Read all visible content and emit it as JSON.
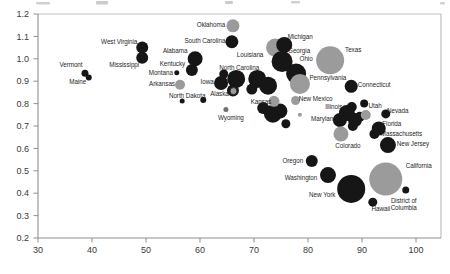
{
  "chart_data": {
    "type": "scatter",
    "title": "",
    "xlabel": "",
    "ylabel": "",
    "xlim": [
      30,
      104.6
    ],
    "ylim": [
      0.2,
      1.2
    ],
    "grid": false,
    "legend": "none",
    "colors": {
      "black": "#161616",
      "gray": "#9b9b9b",
      "darkgray": "#6f6f6f",
      "label": "#1f1f1f",
      "axis": "#8f8f8f",
      "frame": "#bfbfbf",
      "tick_text": "#3a3a3a"
    },
    "x_axis": {
      "ticks": [
        {
          "v": 30,
          "label": "30"
        },
        {
          "v": 40,
          "label": "40"
        },
        {
          "v": 50,
          "label": "50"
        },
        {
          "v": 60,
          "label": "60"
        },
        {
          "v": 70,
          "label": "70"
        },
        {
          "v": 80,
          "label": "80"
        },
        {
          "v": 90,
          "label": "90"
        },
        {
          "v": 100,
          "label": "100"
        }
      ]
    },
    "y_axis": {
      "ticks": [
        {
          "v": 1.2,
          "label": "1.2"
        },
        {
          "v": 1.1,
          "label": "1.1"
        },
        {
          "v": 1.0,
          "label": "1.0"
        },
        {
          "v": 0.9,
          "label": "0.9"
        },
        {
          "v": 0.8,
          "label": "0.8"
        },
        {
          "v": 0.7,
          "label": "0.7"
        },
        {
          "v": 0.6,
          "label": "0.6"
        },
        {
          "v": 0.5,
          "label": "0.5"
        },
        {
          "v": 0.4,
          "label": "0.4"
        },
        {
          "v": 0.3,
          "label": "0.3"
        },
        {
          "v": 0.2,
          "label": "0.2"
        }
      ]
    },
    "points": [
      {
        "name": "Louisiana",
        "x": 73.9,
        "y": 1.05,
        "r": 9,
        "c": "gray",
        "label": {
          "dx": -25,
          "dy": 7,
          "lines": [
            "Louisiana"
          ]
        }
      },
      {
        "name": "Vermont",
        "x": 38.7,
        "y": 0.935,
        "r": 3.5,
        "c": "black",
        "label": {
          "dx": -14,
          "dy": -8,
          "lines": [
            "Vermont"
          ]
        }
      },
      {
        "name": "Maine",
        "x": 39.4,
        "y": 0.917,
        "r": 3,
        "c": "black",
        "label": {
          "dx": -11,
          "dy": 5,
          "lines": [
            "Maine"
          ]
        }
      },
      {
        "name": "West Virginia",
        "x": 49.3,
        "y": 1.05,
        "r": 6,
        "c": "black",
        "label": {
          "dx": -23,
          "dy": -5.5,
          "lines": [
            "West Virginia"
          ]
        }
      },
      {
        "name": "Mississippi",
        "x": 49.3,
        "y": 1.005,
        "r": 6,
        "c": "black",
        "label": {
          "dx": -18,
          "dy": 7.5,
          "lines": [
            "Mississippi"
          ]
        }
      },
      {
        "name": "South Carolina",
        "x": 65.9,
        "y": 1.076,
        "r": 6.5,
        "c": "black",
        "label": {
          "dx": -27,
          "dy": -0.5,
          "lines": [
            "South Carolina"
          ]
        }
      },
      {
        "name": "Alabama",
        "x": 59.1,
        "y": 1.0,
        "r": 7.5,
        "c": "black",
        "label": {
          "dx": -20,
          "dy": -8,
          "lines": [
            "Alabama"
          ]
        }
      },
      {
        "name": "Kentucky",
        "x": 58.5,
        "y": 0.95,
        "r": 6,
        "c": "black",
        "label": {
          "dx": -19.5,
          "dy": -6.5,
          "lines": [
            "Kentucky"
          ]
        }
      },
      {
        "name": "Montana",
        "x": 55.7,
        "y": 0.938,
        "r": 2.5,
        "c": "black",
        "label": {
          "dx": -16,
          "dy": 0,
          "lines": [
            "Montana"
          ]
        }
      },
      {
        "name": "North Dakota",
        "x": 56.7,
        "y": 0.812,
        "r": 2.5,
        "c": "black",
        "label": {
          "dx": 5,
          "dy": -5,
          "lines": [
            "North Dakota"
          ]
        }
      },
      {
        "name": null,
        "x": 60.6,
        "y": 0.816,
        "r": 3,
        "c": "black"
      },
      {
        "name": null,
        "x": 64.4,
        "y": 0.932,
        "r": 4.5,
        "c": "black"
      },
      {
        "name": "Iowa",
        "x": 63.9,
        "y": 0.892,
        "r": 7,
        "c": "black",
        "label": {
          "dx": -14,
          "dy": -0.5,
          "lines": [
            "Iowa"
          ]
        }
      },
      {
        "name": "North Carolina",
        "x": 66.7,
        "y": 0.91,
        "r": 9,
        "c": "black",
        "label": {
          "dx": 3,
          "dy": -11,
          "lines": [
            "North Carolina"
          ]
        }
      },
      {
        "name": null,
        "x": 66.1,
        "y": 0.858,
        "r": 6,
        "c": "black"
      },
      {
        "name": null,
        "x": 70.6,
        "y": 0.91,
        "r": 9,
        "c": "black"
      },
      {
        "name": null,
        "x": 72.6,
        "y": 0.88,
        "r": 9,
        "c": "black"
      },
      {
        "name": null,
        "x": 69.6,
        "y": 0.865,
        "r": 5.5,
        "c": "black"
      },
      {
        "name": "Michigan",
        "x": 75.6,
        "y": 1.062,
        "r": 8,
        "c": "black",
        "label": {
          "dx": 16,
          "dy": -8,
          "lines": [
            "Michigan"
          ]
        }
      },
      {
        "name": "Georgia",
        "x": 75.2,
        "y": 0.988,
        "r": 10.5,
        "c": "black",
        "label": {
          "dx": 17,
          "dy": -10,
          "lines": [
            "Georgia"
          ]
        }
      },
      {
        "name": "Ohio",
        "x": 77.8,
        "y": 0.934,
        "r": 10,
        "c": "black",
        "label": {
          "dx": 10,
          "dy": -15,
          "lines": [
            "Ohio"
          ]
        }
      },
      {
        "name": null,
        "x": 71.7,
        "y": 0.78,
        "r": 6,
        "c": "black"
      },
      {
        "name": null,
        "x": 73.5,
        "y": 0.755,
        "r": 9,
        "c": "black"
      },
      {
        "name": null,
        "x": 74.8,
        "y": 0.767,
        "r": 7.5,
        "c": "black"
      },
      {
        "name": null,
        "x": 75.9,
        "y": 0.71,
        "r": 4.5,
        "c": "black"
      },
      {
        "name": "Connecticut",
        "x": 88.0,
        "y": 0.877,
        "r": 6.5,
        "c": "black",
        "label": {
          "dx": 23,
          "dy": -1,
          "lines": [
            "Connecticut"
          ]
        }
      },
      {
        "name": "Illinois",
        "x": 87.2,
        "y": 0.758,
        "r": 8,
        "c": "black",
        "label": {
          "dx": -13,
          "dy": -6,
          "lines": [
            "Illinois"
          ]
        }
      },
      {
        "name": null,
        "x": 88.7,
        "y": 0.727,
        "r": 7,
        "c": "black"
      },
      {
        "name": null,
        "x": 89.6,
        "y": 0.741,
        "r": 5,
        "c": "black"
      },
      {
        "name": null,
        "x": 88.1,
        "y": 0.785,
        "r": 5,
        "c": "black"
      },
      {
        "name": null,
        "x": 88.3,
        "y": 0.7,
        "r": 5,
        "c": "black"
      },
      {
        "name": "Maryland",
        "x": 85.9,
        "y": 0.727,
        "r": 7,
        "c": "black",
        "label": {
          "dx": -16,
          "dy": -1,
          "lines": [
            "Maryland"
          ]
        }
      },
      {
        "name": "Utah",
        "x": 90.4,
        "y": 0.8,
        "r": 4,
        "c": "black",
        "label": {
          "dx": 11,
          "dy": 2,
          "lines": [
            "Utah"
          ]
        }
      },
      {
        "name": "Nevada",
        "x": 94.4,
        "y": 0.754,
        "r": 4.5,
        "c": "black",
        "label": {
          "dx": 12,
          "dy": -3,
          "lines": [
            "Nevada"
          ]
        }
      },
      {
        "name": "Florida",
        "x": 93.1,
        "y": 0.689,
        "r": 7,
        "c": "black",
        "label": {
          "dx": 13,
          "dy": -4,
          "lines": [
            "Florida"
          ]
        }
      },
      {
        "name": "Massachusetts",
        "x": 92.3,
        "y": 0.664,
        "r": 5,
        "c": "black",
        "label": {
          "dx": 27,
          "dy": 0,
          "lines": [
            "Massachusetts"
          ]
        }
      },
      {
        "name": "New Jersey",
        "x": 94.8,
        "y": 0.615,
        "r": 8,
        "c": "black",
        "label": {
          "dx": 25,
          "dy": -1,
          "lines": [
            "New Jersey"
          ]
        }
      },
      {
        "name": "Oregon",
        "x": 80.7,
        "y": 0.544,
        "r": 6,
        "c": "black",
        "label": {
          "dx": -19,
          "dy": 0,
          "lines": [
            "Oregon"
          ]
        }
      },
      {
        "name": "Washington",
        "x": 83.7,
        "y": 0.481,
        "r": 8,
        "c": "black",
        "label": {
          "dx": -27,
          "dy": 3,
          "lines": [
            "Washington"
          ]
        }
      },
      {
        "name": "New York",
        "x": 88.0,
        "y": 0.419,
        "r": 14,
        "c": "black",
        "label": {
          "dx": -29,
          "dy": 6.5,
          "lines": [
            "New York"
          ]
        }
      },
      {
        "name": "Hawaii",
        "x": 92.0,
        "y": 0.36,
        "r": 4.5,
        "c": "black",
        "label": {
          "dx": 8,
          "dy": 7,
          "lines": [
            "Hawaii"
          ]
        }
      },
      {
        "name": "District of Columbia",
        "x": 98.1,
        "y": 0.414,
        "r": 3.5,
        "c": "black",
        "label": {
          "dx": -2,
          "dy": 14,
          "lines": [
            "District of",
            "Columbia"
          ]
        }
      },
      {
        "name": "Oklahoma",
        "x": 66.1,
        "y": 1.147,
        "r": 6.5,
        "c": "gray",
        "label": {
          "dx": -22,
          "dy": -1,
          "lines": [
            "Oklahoma"
          ]
        }
      },
      {
        "name": "Arkansas",
        "x": 56.3,
        "y": 0.884,
        "r": 5,
        "c": "gray",
        "label": {
          "dx": -18,
          "dy": -1,
          "lines": [
            "Arkansas"
          ]
        }
      },
      {
        "name": "Kansas",
        "x": 73.7,
        "y": 0.81,
        "r": 5.5,
        "c": "gray",
        "label": {
          "dx": -13,
          "dy": 1,
          "lines": [
            "Kansas"
          ]
        }
      },
      {
        "name": "Texas",
        "x": 84.1,
        "y": 0.993,
        "r": 14,
        "c": "gray",
        "label": {
          "dx": 23,
          "dy": -10,
          "lines": [
            "Texas"
          ]
        }
      },
      {
        "name": "Pennsylvania",
        "x": 78.5,
        "y": 0.888,
        "r": 10,
        "c": "gray",
        "label": {
          "dx": 28,
          "dy": -6,
          "lines": [
            "Pennsylvania"
          ]
        }
      },
      {
        "name": "New Mexico",
        "x": 77.7,
        "y": 0.814,
        "r": 4.5,
        "c": "gray",
        "label": {
          "dx": 20,
          "dy": -1.5,
          "lines": [
            "New Mexico"
          ]
        }
      },
      {
        "name": null,
        "x": 90.7,
        "y": 0.749,
        "r": 5,
        "c": "gray"
      },
      {
        "name": null,
        "x": 78.5,
        "y": 0.75,
        "r": 2,
        "c": "gray"
      },
      {
        "name": "Colorado",
        "x": 86.1,
        "y": 0.664,
        "r": 7.5,
        "c": "gray",
        "label": {
          "dx": 7,
          "dy": 12,
          "lines": [
            "Colorado"
          ]
        }
      },
      {
        "name": "California",
        "x": 94.4,
        "y": 0.463,
        "r": 16.5,
        "c": "gray",
        "label": {
          "dx": 33,
          "dy": -13,
          "lines": [
            "California"
          ]
        }
      },
      {
        "name": "Alaska",
        "x": 66.2,
        "y": 0.856,
        "r": 3.5,
        "c": "gray",
        "ring": true,
        "label": {
          "dx": -14,
          "dy": 3,
          "lines": [
            "Alaska"
          ]
        }
      },
      {
        "name": "Wyoming",
        "x": 64.8,
        "y": 0.774,
        "r": 2.5,
        "c": "darkgray",
        "label": {
          "dx": 5,
          "dy": 8.5,
          "lines": [
            "Wyoming"
          ]
        }
      }
    ]
  }
}
